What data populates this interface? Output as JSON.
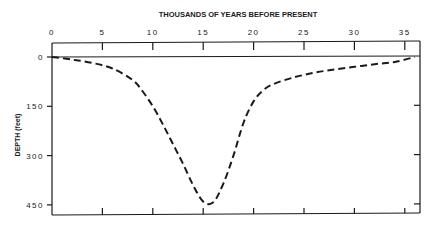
{
  "chart_data": {
    "type": "line",
    "title": "THOUSANDS OF YEARS BEFORE PRESENT",
    "xlabel": "THOUSANDS OF YEARS BEFORE PRESENT",
    "ylabel": "DEPTH (feet)",
    "x_ticks": [
      "0",
      "5",
      "10",
      "15",
      "20",
      "25",
      "30",
      "35"
    ],
    "y_ticks": [
      "0",
      "150",
      "300",
      "450"
    ],
    "xlim": [
      0,
      36
    ],
    "ylim": [
      0,
      470
    ],
    "y_inverted": true,
    "grid": false,
    "line_style": "dashed",
    "series": [
      {
        "name": "Sea level depth",
        "x": [
          0,
          2,
          4,
          6,
          8,
          9,
          10,
          11,
          12,
          13,
          14,
          15,
          16,
          17,
          18,
          19,
          20,
          21,
          22,
          24,
          26,
          28,
          30,
          32,
          34,
          36
        ],
        "y": [
          0,
          8,
          18,
          35,
          70,
          105,
          150,
          205,
          265,
          325,
          390,
          440,
          442,
          385,
          300,
          200,
          135,
          100,
          82,
          62,
          48,
          38,
          30,
          22,
          15,
          0
        ]
      }
    ]
  }
}
